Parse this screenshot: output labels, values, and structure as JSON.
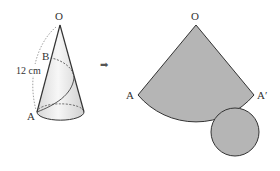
{
  "figure": {
    "left_cone": {
      "apex_label": "O",
      "point_b_label": "B",
      "point_a_label": "A",
      "length_label": "12 cm"
    },
    "arrow": "➡",
    "net": {
      "apex_label": "O",
      "left_label": "A",
      "right_label": "A′"
    },
    "colors": {
      "fill": "#b5b5b5",
      "stroke": "#333333",
      "cone_shade": "#e6e6e6"
    }
  }
}
